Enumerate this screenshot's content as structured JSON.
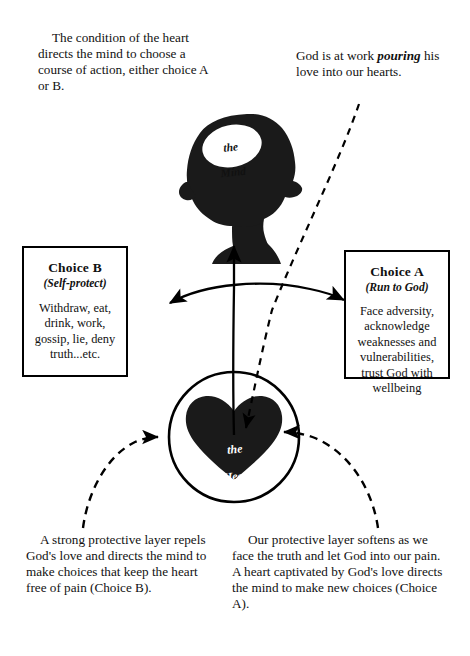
{
  "diagram": {
    "title_text_blocks": {
      "top_left": "The condition of the heart directs the mind to choose a course of action, either choice A or B.",
      "top_right_before": "God is at work ",
      "top_right_emphasis": "pouring",
      "top_right_after": " his love into our hearts.",
      "bottom_left": "A strong protective layer repels God's love and directs the mind to make choices that keep the heart free of pain (Choice B).",
      "bottom_right": "Our protective layer softens as we face the truth and let God into our pain.  A heart captivated by God's love directs the mind to make new choices (Choice A)."
    },
    "mind": {
      "label_line1": "the",
      "label_line2": "Mind"
    },
    "heart": {
      "label_line1": "the",
      "label_line2": "Heart"
    },
    "choice_b": {
      "title": "Choice B",
      "subtitle": "(Self-protect)",
      "body": "Withdraw, eat, drink, work, gossip, lie, deny truth...etc."
    },
    "choice_a": {
      "title": "Choice A",
      "subtitle": "(Run to God)",
      "body": "Face adversity, acknowledge weaknesses and vulnerabilities, trust God with wellbeing"
    },
    "colors": {
      "ink": "#111111",
      "stroke": "#000000",
      "background": "#ffffff",
      "label_on_dark": "#ffffff"
    },
    "connectors": [
      {
        "name": "heart-to-mind-arrow",
        "style": "solid",
        "direction": "up"
      },
      {
        "name": "gods-love-to-heart-arrow",
        "style": "dashed",
        "direction": "down"
      },
      {
        "name": "choice-b-to-choice-a-arrow",
        "style": "solid",
        "direction": "both"
      },
      {
        "name": "bottom-left-to-heart-arrow",
        "style": "dashed",
        "direction": "right"
      },
      {
        "name": "bottom-right-to-heart-arrow",
        "style": "dashed",
        "direction": "left"
      }
    ]
  }
}
